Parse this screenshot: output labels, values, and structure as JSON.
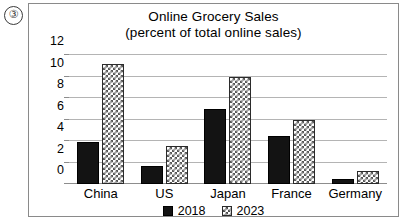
{
  "question_marker": "③",
  "chart_data": {
    "type": "bar",
    "title": "Online Grocery Sales",
    "subtitle": "(percent of total online sales)",
    "xlabel": "",
    "ylabel": "",
    "categories": [
      "China",
      "US",
      "Japan",
      "France",
      "Germany"
    ],
    "series": [
      {
        "name": "2018",
        "values": [
          3.9,
          1.7,
          7.0,
          4.5,
          0.5
        ],
        "style": "solid-black"
      },
      {
        "name": "2023",
        "values": [
          11.2,
          3.5,
          10.0,
          6.0,
          1.2
        ],
        "style": "checkerboard"
      }
    ],
    "ylim": [
      0,
      12
    ],
    "yticks": [
      0,
      2,
      4,
      6,
      8,
      10,
      12
    ],
    "ytick_labels": [
      "0",
      "2",
      "4",
      "6",
      "8",
      "10",
      "12"
    ],
    "grid": true,
    "legend_position": "bottom",
    "legend": [
      {
        "label": "2018",
        "swatch": "solid-square-icon"
      },
      {
        "label": "2023",
        "swatch": "checkered-square-icon"
      }
    ]
  },
  "colors": {
    "series_2018": "#131313",
    "series_2023_pattern": "#575757",
    "gridline": "#b4b4b4",
    "frame": "#8a8a8a",
    "background": "#ffffff"
  }
}
